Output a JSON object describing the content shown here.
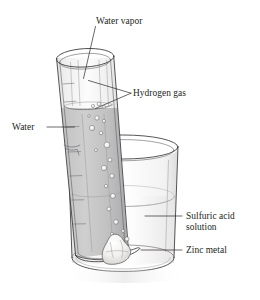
{
  "figure": {
    "type": "science-apparatus-diagram",
    "background_color": "#ffffff",
    "ink_color": "#231f20"
  },
  "labels": [
    {
      "id": "water-vapor",
      "text": "Water vapor",
      "x": 96,
      "y": 24,
      "anchor": "start",
      "points_to": "gas space at top inside the inverted test tube",
      "leader": "M 95.5 26.5 L 83.5 78.5"
    },
    {
      "id": "hydrogen-gas",
      "text": "Hydrogen gas",
      "x": 133,
      "y": 96,
      "anchor": "start",
      "points_to": "collected gas column and rising bubbles inside the test tube",
      "leader_upper": "M 131 93 L 89 81",
      "leader_lower": "M 131 93 L 95.5 108"
    },
    {
      "id": "water",
      "text": "Water",
      "x": 12,
      "y": 130,
      "anchor": "start",
      "points_to": "liquid column standing inside the test tube",
      "leader": "M 47 127 L 74 127"
    },
    {
      "id": "sulfuric-acid-solution",
      "text_line_1": "Sulfuric acid",
      "text_line_2": "solution",
      "x": 186,
      "y": 219,
      "anchor": "start",
      "points_to": "liquid filling the beaker",
      "leader": "M 145 216 L 182 216"
    },
    {
      "id": "zinc-metal",
      "text": "Zinc metal",
      "x": 186,
      "y": 253,
      "anchor": "start",
      "points_to": "lump of metal on the floor of the beaker",
      "leader": "M 141 250 L 182 250"
    }
  ],
  "apparatus": {
    "beaker": {
      "name": "beaker",
      "rim_center_x": 123,
      "rim_center_y": 147,
      "rim_rx": 55,
      "rim_ry": 12,
      "base_center_y": 263,
      "base_rx": 50,
      "base_ry": 11,
      "glass_tint": "#f3f3f4"
    },
    "test_tube": {
      "name": "test-tube",
      "tilt_degrees": 13,
      "mouth_center_x": 85,
      "mouth_center_y": 58,
      "mouth_rx": 29,
      "mouth_ry": 9,
      "closed_end_y": 258,
      "glass_tint": "#c2c2c3"
    },
    "liquid_level_in_tube_y": 108,
    "liquid_level_in_beaker_y": 196,
    "zinc_lump": {
      "name": "zinc-metal-lump",
      "center_x": 116,
      "center_y": 246,
      "fill": "#efeeec"
    },
    "bubble_count": 17
  },
  "palette": {
    "outline": "#3a3738",
    "gas_fill": "#e9e9ea",
    "water_fill": "#bdbdbe",
    "acid_fill": "#f0f0f1",
    "shadow": "#d6d6d7"
  }
}
